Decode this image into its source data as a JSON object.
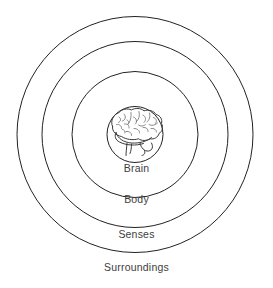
{
  "diagram": {
    "background_color": "#ffffff",
    "stroke_color": "#222222",
    "label_color": "#3d3d3d",
    "center": {
      "x": 135,
      "y": 134.5
    },
    "rings": [
      {
        "id": "surroundings",
        "label": "Surroundings",
        "radius": 118,
        "level": 4
      },
      {
        "id": "senses",
        "label": "Senses",
        "radius": 93,
        "level": 3
      },
      {
        "id": "body",
        "label": "Body",
        "radius": 63,
        "level": 2
      },
      {
        "id": "brain",
        "label": "Brain",
        "radius": 28,
        "level": 1
      }
    ],
    "center_illustration": {
      "name": "brain-illustration",
      "description": "hand-drawn side view of a human brain with cerebral folds, cerebellum and brainstem"
    }
  }
}
